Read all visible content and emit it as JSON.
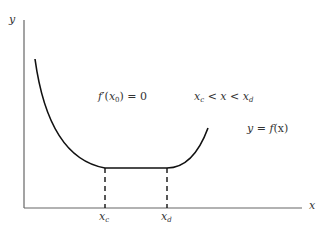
{
  "axes": {
    "y_label": "y",
    "x_label": "x"
  },
  "annotations": {
    "derivative": {
      "f": "f",
      "prime": "′",
      "open": "(",
      "x": "x",
      "sub": "0",
      "close": ") = 0"
    },
    "interval": {
      "x1": "x",
      "sub1": "c",
      "lt1": " < ",
      "x": "x",
      "lt2": " < ",
      "x2": "x",
      "sub2": "d"
    },
    "function": {
      "y": "y",
      "eq": " = ",
      "f": "f",
      "arg": "(x)"
    }
  },
  "ticks": {
    "xc": {
      "base": "x",
      "sub": "c"
    },
    "xd": {
      "base": "x",
      "sub": "d"
    }
  },
  "colors": {
    "axis": "#555555",
    "curve": "#111111",
    "text": "#333333"
  }
}
